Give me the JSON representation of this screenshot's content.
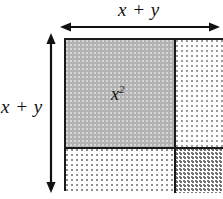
{
  "figure": {
    "kind": "algebra-tiles-area-diagram",
    "background_color": "#ffffff",
    "line_color": "#1a1a1a"
  },
  "labels": {
    "top_dimension": "x + y",
    "left_dimension": "x + y",
    "area_main_base": "x",
    "area_main_exponent": "2"
  },
  "arrows": {
    "top": {
      "name": "horizontal-dimension-arrow",
      "orientation": "horizontal",
      "double_headed": true
    },
    "left": {
      "name": "vertical-dimension-arrow",
      "orientation": "vertical",
      "double_headed": true
    }
  },
  "regions": [
    {
      "name": "x-squared-region",
      "position": "top-left",
      "fill": "solid-grey",
      "color": "#b2b2b2",
      "label": "x²"
    },
    {
      "name": "xy-region-right",
      "position": "top-right",
      "fill": "light-stipple",
      "color": "#ffffff",
      "label": ""
    },
    {
      "name": "xy-region-bottom",
      "position": "bottom-left",
      "fill": "light-stipple",
      "color": "#ffffff",
      "label": ""
    },
    {
      "name": "y-squared-region",
      "position": "bottom-right",
      "fill": "dense-stipple",
      "color": "#ffffff",
      "label": ""
    }
  ]
}
